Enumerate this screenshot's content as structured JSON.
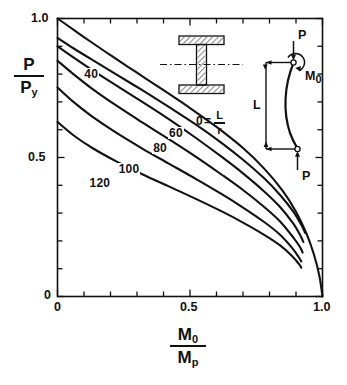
{
  "figure": {
    "background": "#ffffff",
    "ink": "#111111"
  },
  "axes": {
    "x": {
      "label_numerator": "M",
      "label_numerator_sub": "0",
      "label_denominator": "M",
      "label_denominator_sub": "p",
      "ticks": [
        {
          "value": 0,
          "label": "0",
          "major": true
        },
        {
          "value": 0.1,
          "label": "",
          "major": false
        },
        {
          "value": 0.2,
          "label": "",
          "major": false
        },
        {
          "value": 0.3,
          "label": "",
          "major": false
        },
        {
          "value": 0.4,
          "label": "",
          "major": false
        },
        {
          "value": 0.5,
          "label": "0.5",
          "major": true
        },
        {
          "value": 0.6,
          "label": "",
          "major": false
        },
        {
          "value": 0.7,
          "label": "",
          "major": false
        },
        {
          "value": 0.8,
          "label": "",
          "major": false
        },
        {
          "value": 0.9,
          "label": "",
          "major": false
        },
        {
          "value": 1.0,
          "label": "1.0",
          "major": true
        }
      ],
      "range": [
        0,
        1.0
      ]
    },
    "y": {
      "label_numerator": "P",
      "label_denominator": "P",
      "label_denominator_sub": "y",
      "ticks": [
        {
          "value": 0,
          "label": "0",
          "major": true
        },
        {
          "value": 0.1,
          "label": "",
          "major": false
        },
        {
          "value": 0.2,
          "label": "",
          "major": false
        },
        {
          "value": 0.3,
          "label": "",
          "major": false
        },
        {
          "value": 0.4,
          "label": "",
          "major": false
        },
        {
          "value": 0.5,
          "label": "0.5",
          "major": true
        },
        {
          "value": 0.6,
          "label": "",
          "major": false
        },
        {
          "value": 0.7,
          "label": "",
          "major": false
        },
        {
          "value": 0.8,
          "label": "",
          "major": false
        },
        {
          "value": 0.9,
          "label": "",
          "major": false
        },
        {
          "value": 1.0,
          "label": "1.0",
          "major": true
        }
      ],
      "range": [
        0,
        1.0
      ]
    }
  },
  "annotations": {
    "slenderness_key": {
      "prefix": "0",
      "equals": "=",
      "numerator": "L",
      "denominator": "r"
    },
    "column_diagram": {
      "load_top": "P",
      "load_bottom": "P",
      "moment": "M",
      "moment_sub": "0",
      "length": "L"
    }
  },
  "chart_data": {
    "type": "line",
    "title": "",
    "xlabel": "M0/Mp",
    "ylabel": "P/Py",
    "xlim": [
      0,
      1.0
    ],
    "ylim": [
      0,
      1.0
    ],
    "grid": false,
    "legend": "inline-curve-labels",
    "series": [
      {
        "name": "0",
        "label": "0 = L/r",
        "label_x": 0.545,
        "label_y": 0.625,
        "points": [
          [
            0.0,
            1.0
          ],
          [
            0.06,
            0.96
          ],
          [
            0.12,
            0.92
          ],
          [
            0.2,
            0.868
          ],
          [
            0.3,
            0.805
          ],
          [
            0.4,
            0.742
          ],
          [
            0.5,
            0.678
          ],
          [
            0.6,
            0.61
          ],
          [
            0.7,
            0.534
          ],
          [
            0.78,
            0.46
          ],
          [
            0.85,
            0.38
          ],
          [
            0.9,
            0.305
          ],
          [
            0.94,
            0.225
          ],
          [
            0.968,
            0.15
          ],
          [
            0.988,
            0.075
          ],
          [
            1.0,
            0.0
          ]
        ]
      },
      {
        "name": "40",
        "label": "40",
        "label_x": 0.135,
        "label_y": 0.795,
        "points": [
          [
            0.0,
            0.93
          ],
          [
            0.06,
            0.893
          ],
          [
            0.13,
            0.852
          ],
          [
            0.22,
            0.8
          ],
          [
            0.32,
            0.742
          ],
          [
            0.42,
            0.682
          ],
          [
            0.52,
            0.62
          ],
          [
            0.62,
            0.552
          ],
          [
            0.7,
            0.492
          ],
          [
            0.78,
            0.425
          ],
          [
            0.84,
            0.365
          ],
          [
            0.89,
            0.305
          ],
          [
            0.92,
            0.258
          ],
          [
            0.935,
            0.228
          ]
        ]
      },
      {
        "name": "60",
        "label": "60",
        "label_x": 0.455,
        "label_y": 0.585,
        "points": [
          [
            0.0,
            0.9
          ],
          [
            0.06,
            0.86
          ],
          [
            0.13,
            0.815
          ],
          [
            0.22,
            0.76
          ],
          [
            0.32,
            0.7
          ],
          [
            0.42,
            0.638
          ],
          [
            0.52,
            0.572
          ],
          [
            0.62,
            0.502
          ],
          [
            0.7,
            0.443
          ],
          [
            0.78,
            0.378
          ],
          [
            0.84,
            0.322
          ],
          [
            0.89,
            0.262
          ],
          [
            0.915,
            0.222
          ],
          [
            0.928,
            0.196
          ]
        ]
      },
      {
        "name": "80",
        "label": "80",
        "label_x": 0.395,
        "label_y": 0.53,
        "points": [
          [
            0.0,
            0.848
          ],
          [
            0.06,
            0.8
          ],
          [
            0.13,
            0.748
          ],
          [
            0.22,
            0.688
          ],
          [
            0.32,
            0.626
          ],
          [
            0.42,
            0.566
          ],
          [
            0.52,
            0.504
          ],
          [
            0.62,
            0.438
          ],
          [
            0.7,
            0.383
          ],
          [
            0.78,
            0.322
          ],
          [
            0.84,
            0.27
          ],
          [
            0.89,
            0.212
          ],
          [
            0.915,
            0.178
          ],
          [
            0.925,
            0.158
          ]
        ]
      },
      {
        "name": "100",
        "label": "100",
        "label_x": 0.265,
        "label_y": 0.455,
        "points": [
          [
            0.0,
            0.752
          ],
          [
            0.06,
            0.7
          ],
          [
            0.13,
            0.648
          ],
          [
            0.22,
            0.59
          ],
          [
            0.32,
            0.532
          ],
          [
            0.42,
            0.478
          ],
          [
            0.52,
            0.424
          ],
          [
            0.62,
            0.368
          ],
          [
            0.7,
            0.32
          ],
          [
            0.78,
            0.268
          ],
          [
            0.84,
            0.222
          ],
          [
            0.885,
            0.175
          ],
          [
            0.91,
            0.142
          ],
          [
            0.92,
            0.126
          ]
        ]
      },
      {
        "name": "120",
        "label": "120",
        "label_x": 0.155,
        "label_y": 0.405,
        "points": [
          [
            0.0,
            0.628
          ],
          [
            0.06,
            0.58
          ],
          [
            0.13,
            0.535
          ],
          [
            0.22,
            0.487
          ],
          [
            0.32,
            0.44
          ],
          [
            0.42,
            0.396
          ],
          [
            0.52,
            0.352
          ],
          [
            0.62,
            0.306
          ],
          [
            0.7,
            0.266
          ],
          [
            0.78,
            0.222
          ],
          [
            0.84,
            0.184
          ],
          [
            0.885,
            0.146
          ],
          [
            0.91,
            0.118
          ],
          [
            0.92,
            0.104
          ]
        ]
      }
    ]
  }
}
